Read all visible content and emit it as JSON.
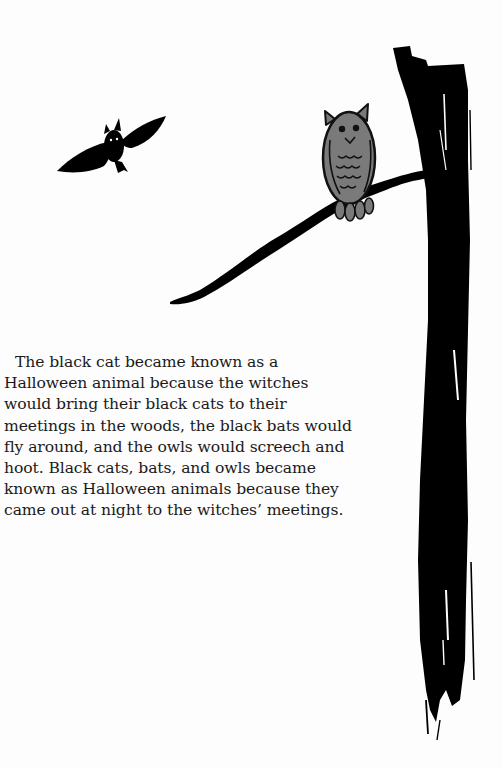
{
  "page": {
    "type": "illustrated storybook page",
    "background_color": "#fdfdfd"
  },
  "illustration": {
    "elements": [
      {
        "name": "bat",
        "description": "black bat flying with spread wings",
        "color": "#000000"
      },
      {
        "name": "owl",
        "description": "gray owl perched on branch",
        "color": "#7a7a7a",
        "outline": "#111111"
      },
      {
        "name": "branch",
        "description": "black tree branch",
        "color": "#000000"
      },
      {
        "name": "tree-trunk",
        "description": "black brushstroke tree trunk",
        "color": "#000000"
      }
    ]
  },
  "story": {
    "lines": [
      "The black cat became known as a",
      "Halloween animal because the witches",
      "would bring their black cats to their",
      "meetings in the woods, the black bats would",
      "fly around, and the owls would screech and",
      "hoot. Black cats, bats, and owls became",
      "known as Halloween animals because they",
      "came out at night to the witches’ meetings."
    ]
  }
}
